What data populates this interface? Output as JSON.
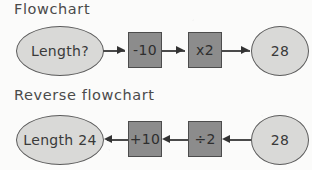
{
  "background_color": "#fbfbfa",
  "palette": {
    "ellipse_fill": "#d9d9d7",
    "ellipse_stroke": "#5b5b5b",
    "box_fill": "#8c8c8c",
    "box_stroke": "#4c4c4c",
    "line": "#4a4a4a",
    "text": "#3a3a3a"
  },
  "forward": {
    "title": "Flowchart",
    "start_label": "Length?",
    "op1_label": "-10",
    "op2_label": "x2",
    "end_label": "28",
    "direction": "right"
  },
  "reverse": {
    "title": "Reverse flowchart",
    "result_label": "Length 24",
    "op1_label": "+10",
    "op2_label": "÷2",
    "start_label": "28",
    "direction": "left"
  }
}
